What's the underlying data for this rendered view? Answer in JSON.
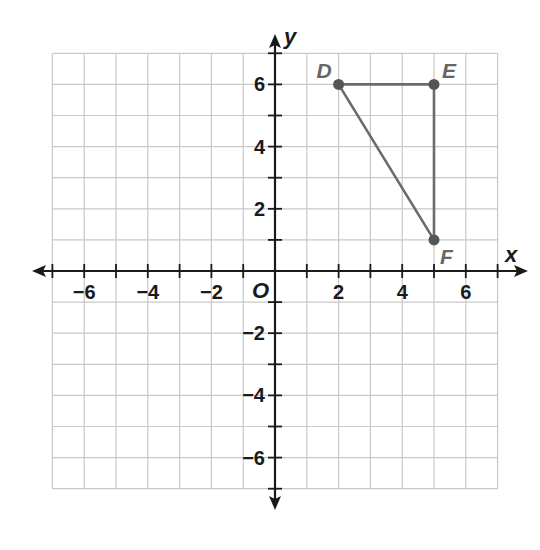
{
  "figure": {
    "x_axis_label": "x",
    "y_axis_label": "y",
    "origin_label": "O",
    "x_ticks": [
      {
        "value": -6,
        "label": "−6"
      },
      {
        "value": -4,
        "label": "−4"
      },
      {
        "value": -2,
        "label": "−2"
      },
      {
        "value": 2,
        "label": "2"
      },
      {
        "value": 4,
        "label": "4"
      },
      {
        "value": 6,
        "label": "6"
      }
    ],
    "y_ticks": [
      {
        "value": 6,
        "label": "6"
      },
      {
        "value": 4,
        "label": "4"
      },
      {
        "value": 2,
        "label": "2"
      },
      {
        "value": -2,
        "label": "−2"
      },
      {
        "value": -4,
        "label": "−4"
      },
      {
        "value": -6,
        "label": "−6"
      }
    ],
    "grid_range": {
      "xmin": -7,
      "xmax": 7,
      "ymin": -7,
      "ymax": 7
    },
    "points": [
      {
        "name": "D",
        "x": 2,
        "y": 6
      },
      {
        "name": "E",
        "x": 5,
        "y": 6
      },
      {
        "name": "F",
        "x": 5,
        "y": 1
      }
    ],
    "polygon": [
      "D",
      "E",
      "F"
    ],
    "colors": {
      "grid": "#c8c8c8",
      "axis": "#1a1a1a",
      "triangle": "#6b6b6b",
      "point": "#555555",
      "point_label": "#666666"
    }
  }
}
